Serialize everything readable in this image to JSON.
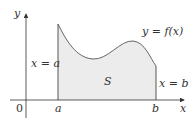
{
  "figure": {
    "y_axis_label": "y",
    "x_axis_label": "x",
    "origin_label": "0",
    "a_tick_label": "a",
    "b_tick_label": "b",
    "left_boundary_label": "x = a",
    "right_boundary_label": "x = b",
    "curve_label": "y = f(x)",
    "region_label": "S",
    "colors": {
      "fill": "#ececec",
      "stroke": "#555555",
      "axis": "#333333",
      "text": "#333333"
    }
  }
}
